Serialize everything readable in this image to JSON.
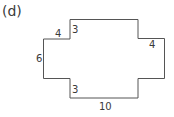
{
  "figure": {
    "part_label": "(d)",
    "shape": "cross-shaped polygon (rectilinear, 12 sides)",
    "stroke_color": "#555555",
    "dimensions": {
      "top_left_notch_width": "4",
      "top_left_notch_height": "3",
      "left_side_height": "6",
      "bottom_left_notch_height": "3",
      "bottom_width": "10",
      "right_notch_width": "4"
    }
  }
}
